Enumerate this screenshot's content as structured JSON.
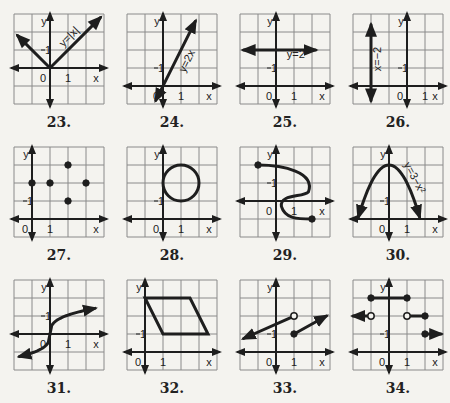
{
  "cell": 18,
  "colors": {
    "grid": "#8a8a8a",
    "ink": "#1e1e1e",
    "paper": "#f4f3ef"
  },
  "graphs": [
    {
      "number": "23.",
      "x": 14,
      "y": 14,
      "origin": [
        2,
        3
      ],
      "labels": {
        "y": "y",
        "x": "x",
        "zero": "0",
        "one_x": "1",
        "one_y": "1"
      },
      "equation": "y=|x|"
    },
    {
      "number": "24.",
      "x": 127,
      "y": 14,
      "origin": [
        2,
        4
      ],
      "labels": {
        "y": "y",
        "x": "x",
        "zero": "0",
        "one_x": "1",
        "one_y": "1"
      },
      "equation": "y=2x"
    },
    {
      "number": "25.",
      "x": 240,
      "y": 14,
      "origin": [
        2,
        4
      ],
      "labels": {
        "y": "y",
        "x": "x",
        "zero": "0",
        "one_x": "1",
        "one_y": "1"
      },
      "equation": "y=2"
    },
    {
      "number": "26.",
      "x": 353,
      "y": 14,
      "origin": [
        3,
        4
      ],
      "labels": {
        "y": "y",
        "x": "x",
        "zero": "0",
        "one_x": "1",
        "one_y": "1"
      },
      "equation": "x=−2"
    },
    {
      "number": "27.",
      "x": 14,
      "y": 147,
      "origin": [
        1,
        4
      ],
      "labels": {
        "y": "y",
        "x": "x",
        "zero": "0",
        "one_x": "1",
        "one_y": "1"
      },
      "points": [
        [
          0,
          2
        ],
        [
          1,
          2
        ],
        [
          2,
          3
        ],
        [
          2,
          1
        ],
        [
          3,
          2
        ]
      ]
    },
    {
      "number": "28.",
      "x": 127,
      "y": 147,
      "origin": [
        2,
        4
      ],
      "labels": {
        "y": "y",
        "x": "x",
        "zero": "0",
        "one_x": "1",
        "one_y": "1"
      },
      "circle": {
        "center": [
          1,
          2
        ],
        "r": 1
      }
    },
    {
      "number": "29.",
      "x": 240,
      "y": 147,
      "origin": [
        2,
        3
      ],
      "labels": {
        "y": "y",
        "x": "x",
        "zero": "0",
        "one_x": "1",
        "one_y": "1"
      },
      "curve": "S-shaped relation from (-1,2) to (2,-1)"
    },
    {
      "number": "30.",
      "x": 353,
      "y": 147,
      "origin": [
        2,
        4
      ],
      "labels": {
        "y": "y",
        "x": "x",
        "zero": "0",
        "one_x": "1",
        "one_y": "1"
      },
      "equation": "y=3−x²"
    },
    {
      "number": "31.",
      "x": 14,
      "y": 280,
      "origin": [
        2,
        3
      ],
      "labels": {
        "y": "y",
        "x": "x",
        "zero": "0",
        "one_x": "1",
        "one_y": "1"
      },
      "curve": "cube-root-like curve through origin"
    },
    {
      "number": "32.",
      "x": 127,
      "y": 280,
      "origin": [
        1,
        4
      ],
      "labels": {
        "y": "y",
        "x": "x",
        "zero": "0",
        "one_x": "1",
        "one_y": "1"
      },
      "polygon": [
        [
          0,
          3
        ],
        [
          2.5,
          3
        ],
        [
          3.5,
          1
        ],
        [
          1,
          1
        ]
      ]
    },
    {
      "number": "33.",
      "x": 240,
      "y": 280,
      "origin": [
        2,
        4
      ],
      "labels": {
        "y": "y",
        "x": "x",
        "zero": "0",
        "one_x": "1",
        "one_y": "1"
      },
      "pieces": "y=x/2+1.5 for x<1 (open at (1,2)); y=x/2+0.5 for x≥1 (closed at (1,1))"
    },
    {
      "number": "34.",
      "x": 353,
      "y": 280,
      "origin": [
        2,
        4
      ],
      "labels": {
        "y": "y",
        "x": "x",
        "zero": "0",
        "one_x": "1",
        "one_y": "1"
      },
      "pieces": "step function: y=2 for x<-1 (open); y=3 on [-1,1]; y=2 on (1,2]; y=1 for x≥2"
    }
  ]
}
